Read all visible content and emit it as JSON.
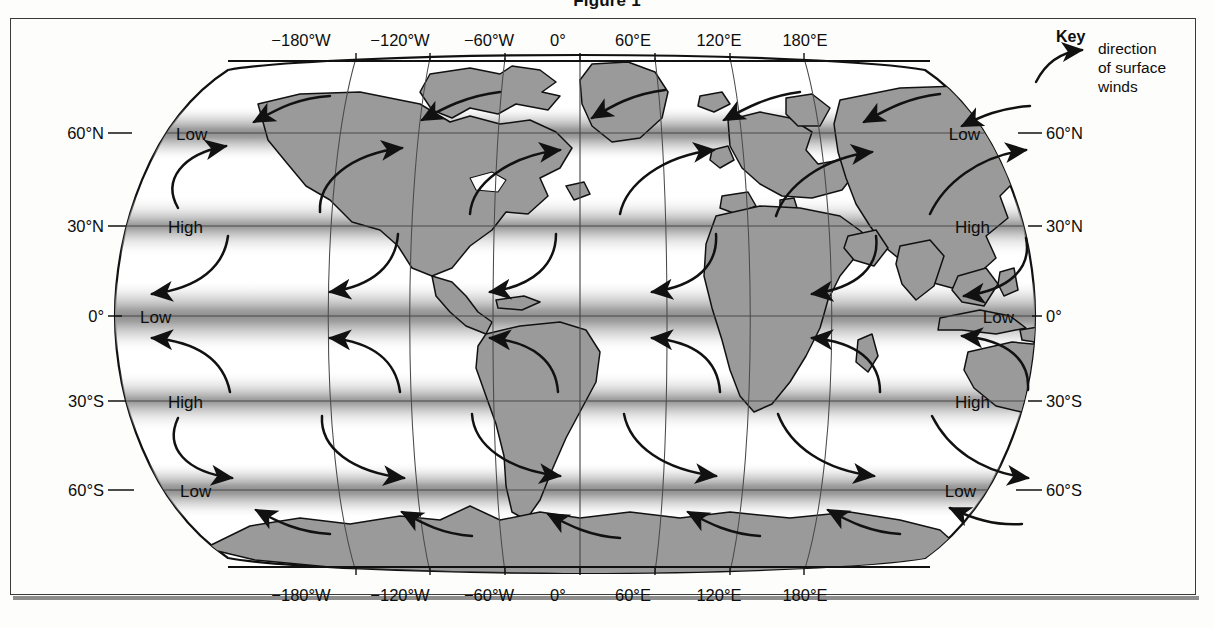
{
  "figure": {
    "title": "Figure 1"
  },
  "key": {
    "heading": "Key",
    "lines": [
      "direction",
      "of surface",
      "winds"
    ],
    "arrow_icon": "curved-arrow-icon"
  },
  "map": {
    "projection": "robinson",
    "land_color": "#9a9a9a",
    "coast_color": "#111111",
    "graticule_color": "#4a4a4a",
    "arrow_color": "#111111",
    "longitude_labels_top": [
      "−180°W",
      "−120°W",
      "−60°W",
      "0°",
      "60°E",
      "120°E",
      "180°E"
    ],
    "longitude_labels_bottom": [
      "−180°W",
      "−120°W",
      "−60°W",
      "0°",
      "60°E",
      "120°E",
      "180°E"
    ],
    "longitude_values": [
      -180,
      -120,
      -60,
      0,
      60,
      120,
      180
    ],
    "latitude_labels_left": [
      "60°N",
      "30°N",
      "0°",
      "30°S",
      "60°S"
    ],
    "latitude_labels_right": [
      "60°N",
      "30°N",
      "0°",
      "30°S",
      "60°S"
    ],
    "latitude_values": [
      60,
      30,
      0,
      -30,
      -60
    ],
    "pressure_bands": [
      {
        "latitude": 60,
        "label_left": "Low",
        "label_right": "Low",
        "type": "low"
      },
      {
        "latitude": 30,
        "label_left": "High",
        "label_right": "High",
        "type": "high"
      },
      {
        "latitude": 0,
        "label_left": "Low",
        "label_right": "Low",
        "type": "low"
      },
      {
        "latitude": -30,
        "label_left": "High",
        "label_right": "High",
        "type": "high"
      },
      {
        "latitude": -60,
        "label_left": "Low",
        "label_right": "Low",
        "type": "low"
      }
    ],
    "wind_cells": [
      {
        "name": "polar-easterlies-north",
        "lat_range": [
          60,
          90
        ],
        "direction": "east-to-west"
      },
      {
        "name": "westerlies-north",
        "lat_range": [
          30,
          60
        ],
        "direction": "west-to-east"
      },
      {
        "name": "trade-winds-north",
        "lat_range": [
          0,
          30
        ],
        "direction": "northeast-to-southwest"
      },
      {
        "name": "trade-winds-south",
        "lat_range": [
          -30,
          0
        ],
        "direction": "southeast-to-northwest"
      },
      {
        "name": "westerlies-south",
        "lat_range": [
          -60,
          -30
        ],
        "direction": "west-to-east"
      },
      {
        "name": "polar-easterlies-south",
        "lat_range": [
          -90,
          -60
        ],
        "direction": "east-to-west"
      }
    ]
  },
  "bleed_text": {
    "lines": [
      "Number of species",
      "Location",
      "e 100",
      "Conclusion",
      "Using evidence from figure 1, which ..."
    ]
  }
}
